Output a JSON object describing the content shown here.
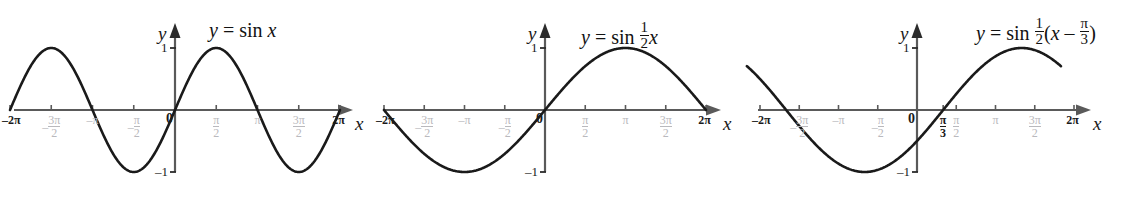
{
  "figure": {
    "background": "#ffffff",
    "curve_color": "#1a1a1a",
    "axis_color": "#5a5a5a",
    "tick_label_color": "#b9b9bd",
    "emph_label_color": "#1a1a1a",
    "panel_count": 3
  },
  "axis_labels": {
    "y": "y",
    "x": "x",
    "origin": "0",
    "y_pos_one": "1",
    "y_neg_one": "–1"
  },
  "panels": [
    {
      "id": "panel-sin-x",
      "title_parts": {
        "lhs": "y",
        "eq": "=",
        "fn": "sin",
        "arg": "x"
      },
      "title_plain": "y = sin x",
      "x_ticks": [
        {
          "label": "–2π",
          "value": -6.283185,
          "emphasis": true,
          "kind": "plain"
        },
        {
          "label": "–3π/2",
          "value": -4.712389,
          "emphasis": false,
          "kind": "fraction",
          "sign": "–",
          "num": "3π",
          "den": "2"
        },
        {
          "label": "–π",
          "value": -3.141593,
          "emphasis": false,
          "kind": "plain"
        },
        {
          "label": "–π/2",
          "value": -1.570796,
          "emphasis": false,
          "kind": "fraction",
          "sign": "–",
          "num": "π",
          "den": "2"
        },
        {
          "label": "0",
          "value": 0.0,
          "emphasis": true,
          "kind": "origin"
        },
        {
          "label": "π/2",
          "value": 1.570796,
          "emphasis": false,
          "kind": "fraction",
          "sign": "",
          "num": "π",
          "den": "2"
        },
        {
          "label": "π",
          "value": 3.141593,
          "emphasis": false,
          "kind": "plain"
        },
        {
          "label": "3π/2",
          "value": 4.712389,
          "emphasis": false,
          "kind": "fraction",
          "sign": "",
          "num": "3π",
          "den": "2"
        },
        {
          "label": "2π",
          "value": 6.283185,
          "emphasis": true,
          "kind": "plain"
        }
      ],
      "y_ticks": [
        {
          "label": "1",
          "value": 1
        },
        {
          "label": "–1",
          "value": -1
        }
      ],
      "chart": {
        "type": "line",
        "function": "sin(x)",
        "amplitude": 1,
        "period": 6.283185,
        "phase_shift": 0,
        "horizontal_stretch": 1,
        "domain": [
          -6.283185,
          6.283185
        ],
        "range": [
          -1,
          1
        ],
        "zeros": [
          -6.283185,
          -3.141593,
          0,
          3.141593,
          6.283185
        ],
        "maxima_x": [
          -4.712389,
          1.570796
        ],
        "minima_x": [
          -1.570796,
          4.712389
        ]
      }
    },
    {
      "id": "panel-sin-half-x",
      "title_parts": {
        "lhs": "y",
        "eq": "=",
        "fn": "sin",
        "coef_num": "1",
        "coef_den": "2",
        "arg": "x"
      },
      "title_plain": "y = sin ½x",
      "x_ticks": [
        {
          "label": "–2π",
          "value": -6.283185,
          "emphasis": true,
          "kind": "plain"
        },
        {
          "label": "–3π/2",
          "value": -4.712389,
          "emphasis": false,
          "kind": "fraction",
          "sign": "–",
          "num": "3π",
          "den": "2"
        },
        {
          "label": "–π",
          "value": -3.141593,
          "emphasis": false,
          "kind": "plain"
        },
        {
          "label": "–π/2",
          "value": -1.570796,
          "emphasis": false,
          "kind": "fraction",
          "sign": "–",
          "num": "π",
          "den": "2"
        },
        {
          "label": "0",
          "value": 0.0,
          "emphasis": true,
          "kind": "origin"
        },
        {
          "label": "π/2",
          "value": 1.570796,
          "emphasis": false,
          "kind": "fraction",
          "sign": "",
          "num": "π",
          "den": "2"
        },
        {
          "label": "π",
          "value": 3.141593,
          "emphasis": false,
          "kind": "plain"
        },
        {
          "label": "3π/2",
          "value": 4.712389,
          "emphasis": false,
          "kind": "fraction",
          "sign": "",
          "num": "3π",
          "den": "2"
        },
        {
          "label": "2π",
          "value": 6.283185,
          "emphasis": true,
          "kind": "plain"
        }
      ],
      "y_ticks": [
        {
          "label": "1",
          "value": 1
        },
        {
          "label": "–1",
          "value": -1
        }
      ],
      "chart": {
        "type": "line",
        "function": "sin(x/2)",
        "amplitude": 1,
        "period": 12.566371,
        "phase_shift": 0,
        "horizontal_stretch": 2,
        "domain": [
          -6.283185,
          6.283185
        ],
        "range": [
          -1,
          1
        ],
        "zeros": [
          -6.283185,
          0,
          6.283185
        ],
        "maxima_x": [
          3.141593
        ],
        "minima_x": [
          -3.141593
        ]
      }
    },
    {
      "id": "panel-sin-half-x-minus-pi-over-3",
      "title_parts": {
        "lhs": "y",
        "eq": "=",
        "fn": "sin",
        "coef_num": "1",
        "coef_den": "2",
        "open": "(",
        "arg": "x",
        "minus": "–",
        "shift_num": "π",
        "shift_den": "3",
        "close": ")"
      },
      "title_plain": "y = sin ½(x – π/3)",
      "x_ticks": [
        {
          "label": "–2π",
          "value": -6.283185,
          "emphasis": true,
          "kind": "plain"
        },
        {
          "label": "–3π/2",
          "value": -4.712389,
          "emphasis": false,
          "kind": "fraction",
          "sign": "–",
          "num": "3π",
          "den": "2"
        },
        {
          "label": "–π",
          "value": -3.141593,
          "emphasis": false,
          "kind": "plain"
        },
        {
          "label": "–π/2",
          "value": -1.570796,
          "emphasis": false,
          "kind": "fraction",
          "sign": "–",
          "num": "π",
          "den": "2"
        },
        {
          "label": "0",
          "value": 0.0,
          "emphasis": true,
          "kind": "origin"
        },
        {
          "label": "π/3",
          "value": 1.047198,
          "emphasis": true,
          "kind": "fraction",
          "sign": "",
          "num": "π",
          "den": "3"
        },
        {
          "label": "π/2",
          "value": 1.570796,
          "emphasis": false,
          "kind": "fraction",
          "sign": "",
          "num": "π",
          "den": "2"
        },
        {
          "label": "π",
          "value": 3.141593,
          "emphasis": false,
          "kind": "plain"
        },
        {
          "label": "3π/2",
          "value": 4.712389,
          "emphasis": false,
          "kind": "fraction",
          "sign": "",
          "num": "3π",
          "den": "2"
        },
        {
          "label": "2π",
          "value": 6.283185,
          "emphasis": true,
          "kind": "plain"
        }
      ],
      "y_ticks": [
        {
          "label": "1",
          "value": 1
        },
        {
          "label": "–1",
          "value": -1
        }
      ],
      "chart": {
        "type": "line",
        "function": "sin((x - pi/3)/2)",
        "amplitude": 1,
        "period": 12.566371,
        "phase_shift": 1.047198,
        "horizontal_stretch": 2,
        "domain": [
          -6.806784,
          5.759587
        ],
        "range": [
          -1,
          1
        ],
        "zeros": [
          1.047198
        ],
        "maxima_x": [
          4.18879
        ],
        "minima_x": [
          -2.094395
        ]
      }
    }
  ],
  "chart_data": {
    "type": "line",
    "xlabel": "x",
    "ylabel": "y",
    "xlim": [
      -6.283185,
      6.283185
    ],
    "ylim": [
      -1.3,
      1.3
    ],
    "grid": false,
    "legend": "none",
    "x_tick_labels": [
      "–2π",
      "–3π/2",
      "–π",
      "–π/2",
      "0",
      "π/2",
      "π",
      "3π/2",
      "2π"
    ],
    "x_tick_values": [
      -6.283185,
      -4.712389,
      -3.141593,
      -1.570796,
      0,
      1.570796,
      3.141593,
      4.712389,
      6.283185
    ],
    "y_tick_labels": [
      "1",
      "–1"
    ],
    "y_tick_values": [
      1,
      -1
    ],
    "series": [
      {
        "name": "y = sin x",
        "function": "sin(x)",
        "panel": 1,
        "period": 6.283185,
        "amplitude": 1,
        "phase_shift": 0
      },
      {
        "name": "y = sin ½x",
        "function": "sin(x/2)",
        "panel": 2,
        "period": 12.566371,
        "amplitude": 1,
        "phase_shift": 0
      },
      {
        "name": "y = sin ½(x – π/3)",
        "function": "sin((x-pi/3)/2)",
        "panel": 3,
        "period": 12.566371,
        "amplitude": 1,
        "phase_shift": 1.047198
      }
    ]
  }
}
